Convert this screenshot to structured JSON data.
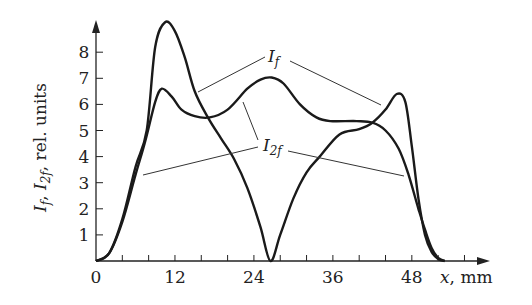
{
  "chart_data": {
    "type": "line",
    "title": "",
    "xlabel": "x, mm",
    "ylabel": "I_f, I_2f, rel. units",
    "xlim": [
      0,
      59
    ],
    "ylim": [
      0,
      9.3
    ],
    "x_ticks": [
      0,
      12,
      24,
      36,
      48
    ],
    "x_minor_step": 4,
    "y_ticks": [
      1,
      2,
      3,
      4,
      5,
      6,
      7,
      8
    ],
    "grid": false,
    "legend": "none (curves labeled directly with leader lines)",
    "series": [
      {
        "name": "I_f",
        "x": [
          0,
          2,
          4,
          6,
          7.7,
          9,
          10.5,
          12,
          13.5,
          15,
          17,
          19,
          21,
          23,
          25,
          26.5,
          28,
          30,
          32,
          34,
          37,
          40,
          42,
          44,
          45.7,
          47,
          48,
          49,
          50,
          51,
          52,
          53
        ],
        "y": [
          0,
          0.3,
          1.6,
          3.6,
          5.0,
          8.2,
          9.15,
          8.8,
          7.8,
          6.5,
          5.5,
          4.7,
          3.9,
          2.8,
          1.3,
          0,
          1.0,
          2.4,
          3.4,
          4.0,
          4.85,
          5.05,
          5.3,
          5.8,
          6.4,
          6.1,
          4.4,
          2.4,
          1.0,
          0.35,
          0.08,
          0
        ]
      },
      {
        "name": "I_2f",
        "x": [
          0,
          2,
          4,
          6,
          7.5,
          9,
          10,
          11.5,
          13,
          15,
          17.3,
          20,
          23,
          25,
          26.7,
          28.5,
          31,
          33.5,
          35.6,
          39.6,
          42,
          44,
          46,
          47.5,
          49,
          50,
          51,
          52,
          53
        ],
        "y": [
          0,
          0.3,
          1.5,
          3.3,
          4.6,
          6.1,
          6.6,
          6.3,
          5.8,
          5.55,
          5.5,
          5.8,
          6.6,
          6.95,
          7.03,
          6.8,
          6.0,
          5.5,
          5.36,
          5.36,
          5.3,
          5.0,
          4.3,
          3.3,
          2.0,
          1.2,
          0.5,
          0.12,
          0
        ]
      }
    ],
    "annotations": [
      {
        "text": "I_f",
        "points_to": [
          "I_f near x=15mm",
          "I_f near x=44.5mm"
        ]
      },
      {
        "text": "I_2f",
        "points_to": [
          "I_2f near x=7.2mm",
          "I_2f near x=22.5mm",
          "I_2f near x=46.5mm"
        ]
      }
    ]
  },
  "labels": {
    "x_axis_var": "x",
    "x_axis_unit": ", mm",
    "y_axis_I": "I",
    "y_axis_f1": "f",
    "y_axis_sep1": ", ",
    "y_axis_f2": "2f",
    "y_axis_rest": ", rel. units",
    "curve_If_main": "I",
    "curve_If_sub": "f",
    "curve_I2f_main": "I",
    "curve_I2f_sub": "2f"
  }
}
